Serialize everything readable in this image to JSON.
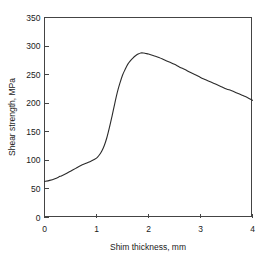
{
  "chart_data": {
    "type": "line",
    "title": "",
    "xlabel": "Shim thickness, mm",
    "ylabel": "Shear strength, MPa",
    "xlim": [
      0,
      4
    ],
    "ylim": [
      0,
      350
    ],
    "xticks": [
      0,
      1,
      2,
      3,
      4
    ],
    "yticks": [
      0,
      50,
      100,
      150,
      200,
      250,
      300,
      350
    ],
    "xtick_labels": [
      "0",
      "1",
      "2",
      "3",
      "4"
    ],
    "ytick_labels": [
      "0",
      "50",
      "100",
      "150",
      "200",
      "250",
      "300",
      "350"
    ],
    "grid": false,
    "legend": false,
    "legend_position": "none",
    "series": [
      {
        "name": "Shear strength",
        "color": "#2b2b2b",
        "marker": "none",
        "x": [
          0.0,
          0.1,
          0.2,
          0.3,
          0.4,
          0.5,
          0.6,
          0.7,
          0.8,
          0.9,
          1.0,
          1.05,
          1.1,
          1.15,
          1.2,
          1.25,
          1.3,
          1.35,
          1.4,
          1.45,
          1.5,
          1.55,
          1.6,
          1.65,
          1.7,
          1.75,
          1.8,
          1.85,
          1.9,
          1.95,
          2.0,
          2.1,
          2.2,
          2.3,
          2.4,
          2.5,
          2.6,
          2.7,
          2.8,
          2.9,
          3.0,
          3.1,
          3.2,
          3.3,
          3.4,
          3.5,
          3.6,
          3.7,
          3.8,
          3.9,
          4.0
        ],
        "y": [
          63,
          65,
          68,
          72,
          76,
          81,
          86,
          91,
          95,
          99,
          104,
          109,
          116,
          126,
          140,
          158,
          178,
          199,
          219,
          235,
          249,
          259,
          268,
          274,
          279,
          283,
          286,
          288,
          288,
          287,
          286,
          283,
          280,
          276,
          272,
          268,
          263,
          259,
          254,
          250,
          245,
          241,
          237,
          233,
          229,
          225,
          222,
          218,
          214,
          210,
          205
        ]
      }
    ],
    "annotations": {
      "peak_value": 288,
      "peak_x": 1.87,
      "start_value": 63,
      "end_value": 205
    }
  },
  "axes": {
    "box": {
      "left_px": 44,
      "right_px": 252,
      "top_px": 17,
      "bottom_px": 217
    },
    "frame_color": "#444444"
  }
}
